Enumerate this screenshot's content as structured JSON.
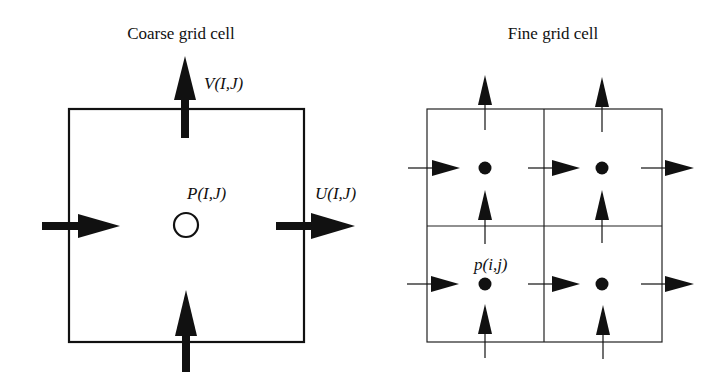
{
  "panels": {
    "coarse": {
      "title": "Coarse grid cell",
      "labels": {
        "v": "V(I,J)",
        "p": "P(I,J)",
        "u": "U(I,J)"
      }
    },
    "fine": {
      "title": "Fine grid cell",
      "labels": {
        "p": "p(i,j)"
      },
      "grid": {
        "rows": 2,
        "cols": 2
      }
    }
  },
  "colors": {
    "stroke": "#111111",
    "background": "#ffffff"
  }
}
